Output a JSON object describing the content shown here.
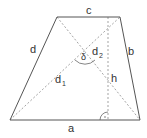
{
  "diagram": {
    "labels": {
      "a": "a",
      "b": "b",
      "c": "c",
      "d": "d",
      "d1": "d",
      "d1_sub": "1",
      "d2": "d",
      "d2_sub": "2",
      "h": "h",
      "delta": "δ"
    },
    "vertices": {
      "bottom_left": [
        10,
        120
      ],
      "bottom_right": [
        140,
        120
      ],
      "top_right": [
        120,
        17
      ],
      "top_left": [
        57,
        17
      ]
    },
    "colors": {
      "stroke": "#555555",
      "dashed": "#888888",
      "text": "#333333"
    }
  }
}
